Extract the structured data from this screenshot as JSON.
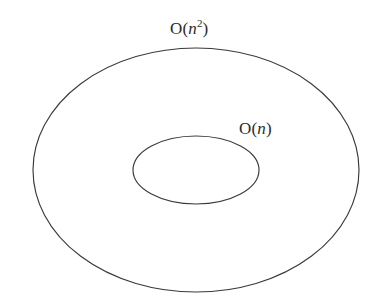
{
  "figure": {
    "type": "nested-set-diagram",
    "background_color": "#ffffff",
    "stroke_color": "#3a3a3a",
    "text_color": "#2b2b2b",
    "caption": "",
    "sets": [
      {
        "id": "outer",
        "name": "outer-set",
        "label_full": "O(n2)",
        "label_fn": "O",
        "label_open_paren": "(",
        "label_var": "n",
        "label_exponent": "2",
        "label_close_paren": ")",
        "shape": "ellipse",
        "center_x": 196,
        "center_y": 170,
        "radius_x": 163,
        "radius_y": 122
      },
      {
        "id": "inner",
        "name": "inner-set",
        "label_full": "O(n)",
        "label_fn": "O",
        "label_open_paren": "(",
        "label_var": "n",
        "label_exponent": "",
        "label_close_paren": ")",
        "shape": "ellipse",
        "center_x": 196,
        "center_y": 170,
        "radius_x": 63,
        "radius_y": 34
      }
    ]
  }
}
